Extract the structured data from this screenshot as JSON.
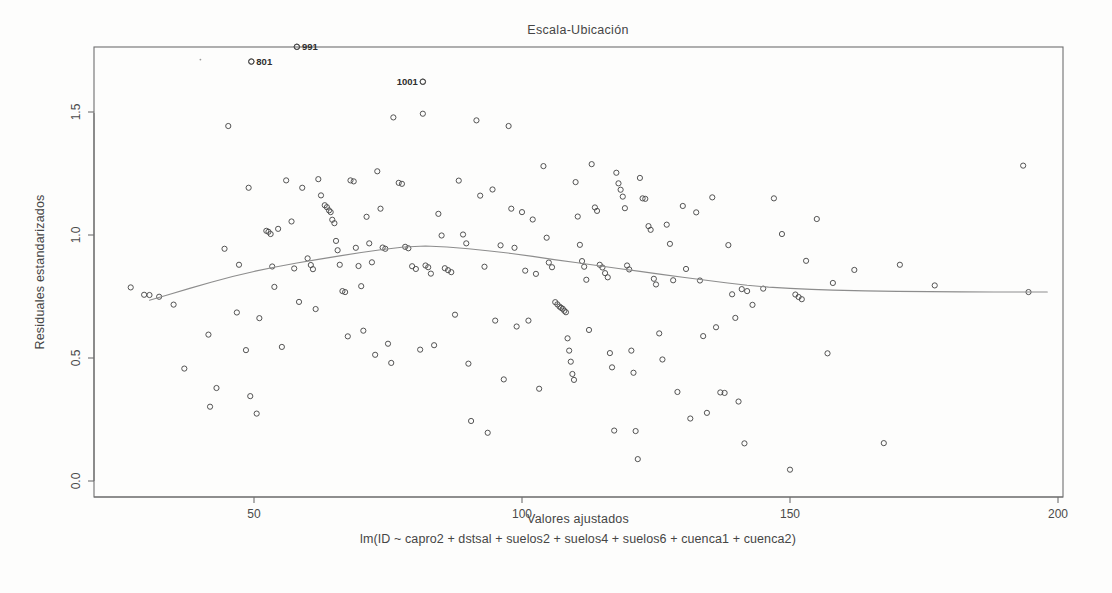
{
  "chart_data": {
    "type": "scatter",
    "title": "Escala-Ubicación",
    "xlabel": "Valores ajustados",
    "ylabel": "Residuales estandarizados",
    "subtitle": "lm(ID ~ capro2 + dstsal + suelos2 + suelos4 + suelos6 + cuenca1 + cuenca2)",
    "grid": false,
    "legend": "none",
    "xlim": [
      24,
      205
    ],
    "ylim": [
      -0.07,
      1.85
    ],
    "xticks": [
      50,
      100,
      150,
      200
    ],
    "xtick_labels": [
      "50",
      "100",
      "150",
      "200"
    ],
    "yticks": [
      0.0,
      0.5,
      1.0,
      1.5
    ],
    "ytick_labels": [
      "0.0",
      "0.5",
      "1.0",
      "1.5"
    ],
    "point_marker": "open-circle",
    "point_color": "#4b4b4b",
    "smooth_color": "#8d8d8d",
    "labeled_points": [
      {
        "label": "991",
        "x": 58.0,
        "y": 1.765,
        "anchor": "right"
      },
      {
        "label": "801",
        "x": 49.5,
        "y": 1.705,
        "anchor": "right"
      },
      {
        "label": "1001",
        "x": 81.5,
        "y": 1.623,
        "anchor": "left"
      }
    ],
    "smooth_series": {
      "name": "loess",
      "x": [
        30.5,
        34,
        38,
        42,
        46,
        50,
        54,
        58,
        62,
        66,
        70,
        74,
        78,
        82,
        86,
        90,
        94,
        98,
        102,
        106,
        110,
        114,
        118,
        122,
        126,
        130,
        134,
        138,
        142,
        146,
        150,
        154,
        158,
        164,
        170,
        176,
        182,
        188,
        194,
        198
      ],
      "y": [
        0.735,
        0.757,
        0.783,
        0.808,
        0.831,
        0.852,
        0.87,
        0.886,
        0.901,
        0.915,
        0.929,
        0.941,
        0.951,
        0.955,
        0.951,
        0.944,
        0.935,
        0.925,
        0.913,
        0.9,
        0.888,
        0.876,
        0.864,
        0.852,
        0.84,
        0.828,
        0.817,
        0.806,
        0.796,
        0.788,
        0.783,
        0.779,
        0.776,
        0.773,
        0.771,
        0.77,
        0.769,
        0.768,
        0.768,
        0.768
      ]
    },
    "points": [
      {
        "x": 27.0,
        "y": 0.787
      },
      {
        "x": 29.5,
        "y": 0.757
      },
      {
        "x": 30.5,
        "y": 0.756
      },
      {
        "x": 32.3,
        "y": 0.749
      },
      {
        "x": 35.0,
        "y": 0.717
      },
      {
        "x": 37.0,
        "y": 0.457
      },
      {
        "x": 41.5,
        "y": 0.595
      },
      {
        "x": 41.8,
        "y": 0.302
      },
      {
        "x": 43.0,
        "y": 0.378
      },
      {
        "x": 44.5,
        "y": 0.944
      },
      {
        "x": 45.2,
        "y": 1.443
      },
      {
        "x": 46.8,
        "y": 0.685
      },
      {
        "x": 47.2,
        "y": 0.879
      },
      {
        "x": 48.5,
        "y": 0.532
      },
      {
        "x": 49.0,
        "y": 1.192
      },
      {
        "x": 49.3,
        "y": 0.345
      },
      {
        "x": 49.5,
        "y": 1.705
      },
      {
        "x": 50.5,
        "y": 0.274
      },
      {
        "x": 51.0,
        "y": 0.662
      },
      {
        "x": 52.3,
        "y": 1.017
      },
      {
        "x": 52.7,
        "y": 1.013
      },
      {
        "x": 53.1,
        "y": 1.004
      },
      {
        "x": 53.4,
        "y": 0.872
      },
      {
        "x": 53.8,
        "y": 0.789
      },
      {
        "x": 54.5,
        "y": 1.025
      },
      {
        "x": 55.2,
        "y": 0.545
      },
      {
        "x": 56.0,
        "y": 1.222
      },
      {
        "x": 57.0,
        "y": 1.055
      },
      {
        "x": 57.5,
        "y": 0.864
      },
      {
        "x": 58.0,
        "y": 1.765
      },
      {
        "x": 58.4,
        "y": 0.728
      },
      {
        "x": 59.0,
        "y": 1.192
      },
      {
        "x": 60.0,
        "y": 0.905
      },
      {
        "x": 60.6,
        "y": 0.878
      },
      {
        "x": 61.0,
        "y": 0.861
      },
      {
        "x": 61.5,
        "y": 0.699
      },
      {
        "x": 62.0,
        "y": 1.227
      },
      {
        "x": 62.5,
        "y": 1.161
      },
      {
        "x": 63.2,
        "y": 1.121
      },
      {
        "x": 63.6,
        "y": 1.113
      },
      {
        "x": 64.0,
        "y": 1.1
      },
      {
        "x": 64.3,
        "y": 1.093
      },
      {
        "x": 64.6,
        "y": 1.062
      },
      {
        "x": 65.0,
        "y": 1.048
      },
      {
        "x": 65.3,
        "y": 0.976
      },
      {
        "x": 65.6,
        "y": 0.938
      },
      {
        "x": 66.0,
        "y": 0.879
      },
      {
        "x": 66.5,
        "y": 0.772
      },
      {
        "x": 67.0,
        "y": 0.768
      },
      {
        "x": 67.5,
        "y": 0.588
      },
      {
        "x": 68.0,
        "y": 1.222
      },
      {
        "x": 68.6,
        "y": 1.218
      },
      {
        "x": 69.0,
        "y": 0.948
      },
      {
        "x": 69.5,
        "y": 0.874
      },
      {
        "x": 70.0,
        "y": 0.792
      },
      {
        "x": 70.4,
        "y": 0.611
      },
      {
        "x": 71.0,
        "y": 1.074
      },
      {
        "x": 71.5,
        "y": 0.966
      },
      {
        "x": 72.0,
        "y": 0.889
      },
      {
        "x": 72.6,
        "y": 0.513
      },
      {
        "x": 73.0,
        "y": 1.259
      },
      {
        "x": 73.6,
        "y": 1.107
      },
      {
        "x": 74.0,
        "y": 0.949
      },
      {
        "x": 74.5,
        "y": 0.944
      },
      {
        "x": 75.0,
        "y": 0.558
      },
      {
        "x": 75.6,
        "y": 0.48
      },
      {
        "x": 76.0,
        "y": 1.478
      },
      {
        "x": 77.0,
        "y": 1.212
      },
      {
        "x": 77.6,
        "y": 1.208
      },
      {
        "x": 78.2,
        "y": 0.952
      },
      {
        "x": 78.8,
        "y": 0.946
      },
      {
        "x": 79.5,
        "y": 0.873
      },
      {
        "x": 80.2,
        "y": 0.862
      },
      {
        "x": 81.0,
        "y": 0.534
      },
      {
        "x": 81.5,
        "y": 1.623
      },
      {
        "x": 81.5,
        "y": 1.493
      },
      {
        "x": 82.0,
        "y": 0.876
      },
      {
        "x": 82.5,
        "y": 0.869
      },
      {
        "x": 83.0,
        "y": 0.843
      },
      {
        "x": 83.6,
        "y": 0.552
      },
      {
        "x": 84.4,
        "y": 1.086
      },
      {
        "x": 85.0,
        "y": 0.998
      },
      {
        "x": 85.6,
        "y": 0.865
      },
      {
        "x": 86.2,
        "y": 0.857
      },
      {
        "x": 86.8,
        "y": 0.849
      },
      {
        "x": 87.5,
        "y": 0.676
      },
      {
        "x": 88.2,
        "y": 1.221
      },
      {
        "x": 89.0,
        "y": 1.002
      },
      {
        "x": 89.6,
        "y": 0.966
      },
      {
        "x": 90.0,
        "y": 0.477
      },
      {
        "x": 90.5,
        "y": 0.244
      },
      {
        "x": 91.5,
        "y": 1.466
      },
      {
        "x": 92.2,
        "y": 1.16
      },
      {
        "x": 93.0,
        "y": 0.871
      },
      {
        "x": 93.6,
        "y": 0.196
      },
      {
        "x": 94.5,
        "y": 1.185
      },
      {
        "x": 95.0,
        "y": 0.652
      },
      {
        "x": 96.0,
        "y": 0.958
      },
      {
        "x": 96.6,
        "y": 0.413
      },
      {
        "x": 97.5,
        "y": 1.443
      },
      {
        "x": 98.0,
        "y": 1.107
      },
      {
        "x": 98.6,
        "y": 0.948
      },
      {
        "x": 99.0,
        "y": 0.628
      },
      {
        "x": 100.0,
        "y": 1.093
      },
      {
        "x": 100.6,
        "y": 0.855
      },
      {
        "x": 101.2,
        "y": 0.652
      },
      {
        "x": 102.0,
        "y": 1.063
      },
      {
        "x": 102.6,
        "y": 0.842
      },
      {
        "x": 103.2,
        "y": 0.375
      },
      {
        "x": 104.0,
        "y": 1.28
      },
      {
        "x": 104.6,
        "y": 0.989
      },
      {
        "x": 105.0,
        "y": 0.888
      },
      {
        "x": 105.6,
        "y": 0.869
      },
      {
        "x": 106.2,
        "y": 0.727
      },
      {
        "x": 106.6,
        "y": 0.718
      },
      {
        "x": 107.0,
        "y": 0.709
      },
      {
        "x": 107.3,
        "y": 0.704
      },
      {
        "x": 107.6,
        "y": 0.7
      },
      {
        "x": 107.9,
        "y": 0.692
      },
      {
        "x": 108.2,
        "y": 0.686
      },
      {
        "x": 108.5,
        "y": 0.58
      },
      {
        "x": 108.8,
        "y": 0.53
      },
      {
        "x": 109.1,
        "y": 0.485
      },
      {
        "x": 109.4,
        "y": 0.435
      },
      {
        "x": 109.7,
        "y": 0.411
      },
      {
        "x": 110.0,
        "y": 1.215
      },
      {
        "x": 110.4,
        "y": 1.075
      },
      {
        "x": 110.8,
        "y": 0.96
      },
      {
        "x": 111.2,
        "y": 0.894
      },
      {
        "x": 111.6,
        "y": 0.871
      },
      {
        "x": 112.0,
        "y": 0.818
      },
      {
        "x": 112.5,
        "y": 0.614
      },
      {
        "x": 113.0,
        "y": 1.288
      },
      {
        "x": 113.6,
        "y": 1.112
      },
      {
        "x": 114.0,
        "y": 1.098
      },
      {
        "x": 114.5,
        "y": 0.879
      },
      {
        "x": 115.0,
        "y": 0.868
      },
      {
        "x": 115.5,
        "y": 0.845
      },
      {
        "x": 116.0,
        "y": 0.828
      },
      {
        "x": 116.4,
        "y": 0.52
      },
      {
        "x": 116.8,
        "y": 0.462
      },
      {
        "x": 117.2,
        "y": 0.205
      },
      {
        "x": 117.6,
        "y": 1.253
      },
      {
        "x": 118.0,
        "y": 1.21
      },
      {
        "x": 118.4,
        "y": 1.184
      },
      {
        "x": 118.8,
        "y": 1.156
      },
      {
        "x": 119.2,
        "y": 1.109
      },
      {
        "x": 119.6,
        "y": 0.876
      },
      {
        "x": 120.0,
        "y": 0.86
      },
      {
        "x": 120.4,
        "y": 0.53
      },
      {
        "x": 120.8,
        "y": 0.44
      },
      {
        "x": 121.2,
        "y": 0.203
      },
      {
        "x": 121.6,
        "y": 0.089
      },
      {
        "x": 122.0,
        "y": 1.232
      },
      {
        "x": 122.5,
        "y": 1.149
      },
      {
        "x": 123.0,
        "y": 1.147
      },
      {
        "x": 123.6,
        "y": 1.036
      },
      {
        "x": 124.0,
        "y": 1.021
      },
      {
        "x": 124.6,
        "y": 0.822
      },
      {
        "x": 125.0,
        "y": 0.799
      },
      {
        "x": 125.6,
        "y": 0.6
      },
      {
        "x": 126.2,
        "y": 0.494
      },
      {
        "x": 127.0,
        "y": 1.042
      },
      {
        "x": 127.6,
        "y": 0.964
      },
      {
        "x": 128.2,
        "y": 0.816
      },
      {
        "x": 129.0,
        "y": 0.362
      },
      {
        "x": 130.0,
        "y": 1.118
      },
      {
        "x": 130.6,
        "y": 0.862
      },
      {
        "x": 131.4,
        "y": 0.254
      },
      {
        "x": 132.5,
        "y": 1.092
      },
      {
        "x": 133.2,
        "y": 0.815
      },
      {
        "x": 133.8,
        "y": 0.589
      },
      {
        "x": 134.5,
        "y": 0.277
      },
      {
        "x": 135.5,
        "y": 1.153
      },
      {
        "x": 136.2,
        "y": 0.625
      },
      {
        "x": 137.0,
        "y": 0.36
      },
      {
        "x": 137.8,
        "y": 0.358
      },
      {
        "x": 138.5,
        "y": 0.959
      },
      {
        "x": 139.2,
        "y": 0.759
      },
      {
        "x": 139.8,
        "y": 0.663
      },
      {
        "x": 140.4,
        "y": 0.323
      },
      {
        "x": 141.0,
        "y": 0.78
      },
      {
        "x": 141.5,
        "y": 0.153
      },
      {
        "x": 142.0,
        "y": 0.772
      },
      {
        "x": 143.0,
        "y": 0.716
      },
      {
        "x": 145.0,
        "y": 0.782
      },
      {
        "x": 147.0,
        "y": 1.149
      },
      {
        "x": 148.5,
        "y": 1.004
      },
      {
        "x": 150.0,
        "y": 0.046
      },
      {
        "x": 151.0,
        "y": 0.758
      },
      {
        "x": 151.6,
        "y": 0.748
      },
      {
        "x": 152.2,
        "y": 0.739
      },
      {
        "x": 153.0,
        "y": 0.895
      },
      {
        "x": 155.0,
        "y": 1.065
      },
      {
        "x": 157.0,
        "y": 0.519
      },
      {
        "x": 158.0,
        "y": 0.805
      },
      {
        "x": 162.0,
        "y": 0.858
      },
      {
        "x": 167.5,
        "y": 0.154
      },
      {
        "x": 170.5,
        "y": 0.879
      },
      {
        "x": 177.0,
        "y": 0.795
      },
      {
        "x": 193.5,
        "y": 1.282
      },
      {
        "x": 194.5,
        "y": 0.768
      }
    ],
    "specks": [
      {
        "x": 40.0,
        "y": 1.713
      }
    ]
  }
}
